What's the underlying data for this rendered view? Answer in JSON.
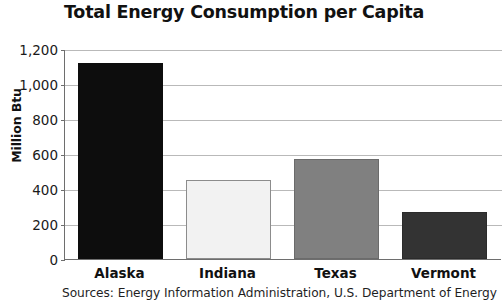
{
  "chart_data": {
    "type": "bar",
    "title": "Total Energy Consumption per Capita",
    "xlabel": "",
    "ylabel": "Million Btu",
    "categories": [
      "Alaska",
      "Indiana",
      "Texas",
      "Vermont"
    ],
    "values": [
      1120,
      450,
      570,
      270
    ],
    "series": [
      {
        "name": "Total Energy Consumption per Capita",
        "values": [
          1120,
          450,
          570,
          270
        ]
      }
    ],
    "bar_colors": [
      "#0d0d0d",
      "#f2f2f2",
      "#808080",
      "#333333"
    ],
    "bar_border_colors": [
      "#0d0d0d",
      "#8c8c8c",
      "#6b6b6b",
      "#2b2b2b"
    ],
    "ylim": [
      0,
      1200
    ],
    "ytick_values": [
      0,
      200,
      400,
      600,
      800,
      1000,
      1200
    ],
    "ytick_labels": [
      "0",
      "200",
      "400",
      "600",
      "800",
      "1,000",
      "1,200"
    ],
    "grid": true,
    "legend": false,
    "legend_position": "none",
    "annotations": [
      "Sources: Energy Information Administration, U.S. Department of Energy"
    ]
  },
  "footer": {
    "source": "Sources: Energy Information Administration, U.S. Department of Energy"
  }
}
